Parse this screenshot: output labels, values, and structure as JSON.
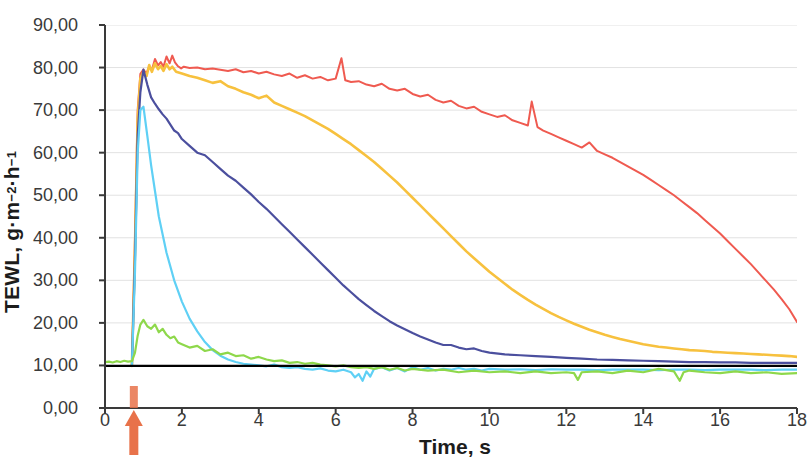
{
  "chart_data": {
    "type": "line",
    "title": "",
    "xlabel": "Time, s",
    "ylabel": "TEWL, g·m⁻²·h⁻¹",
    "ylabel_parts": {
      "main": "TEWL, g·m",
      "sup1": "−2",
      "mid": "·h",
      "sup2": "−1"
    },
    "xlim": [
      0,
      18
    ],
    "ylim": [
      0,
      90
    ],
    "grid": "horizontal",
    "legend": "none",
    "xticks": [
      "0",
      "2",
      "4",
      "6",
      "8",
      "10",
      "12",
      "14",
      "16",
      "18"
    ],
    "xtick_values": [
      0,
      2,
      4,
      6,
      8,
      10,
      12,
      14,
      16,
      18
    ],
    "yticks": [
      "0,00",
      "10,00",
      "20,00",
      "30,00",
      "40,00",
      "50,00",
      "60,00",
      "70,00",
      "80,00",
      "90,00"
    ],
    "ytick_values": [
      0,
      10,
      20,
      30,
      40,
      50,
      60,
      70,
      80,
      90
    ],
    "annotations": [
      {
        "name": "application-arrow",
        "type": "arrow-up",
        "x": 0.75,
        "color": "#e8724a",
        "description": "orange up arrow below x-axis at t=0.75 s"
      }
    ],
    "reference_line": {
      "name": "baseline",
      "y": 9.9,
      "color": "#000000",
      "width": 2.4,
      "x_from": 0,
      "x_to": 18
    },
    "series": [
      {
        "name": "series-red",
        "color": "#ef5a50",
        "width": 2.0,
        "x": [
          0.7,
          0.78,
          0.85,
          0.92,
          1.0,
          1.08,
          1.15,
          1.22,
          1.3,
          1.38,
          1.45,
          1.52,
          1.6,
          1.68,
          1.75,
          1.82,
          1.9,
          1.98,
          2.05,
          2.2,
          2.4,
          2.6,
          2.8,
          3.0,
          3.2,
          3.4,
          3.6,
          3.8,
          4.0,
          4.2,
          4.4,
          4.6,
          4.8,
          5.0,
          5.2,
          5.4,
          5.6,
          5.8,
          6.0,
          6.15,
          6.25,
          6.4,
          6.6,
          6.8,
          7.0,
          7.2,
          7.4,
          7.6,
          7.8,
          8.0,
          8.2,
          8.4,
          8.6,
          8.8,
          9.0,
          9.2,
          9.4,
          9.6,
          9.8,
          10.0,
          10.2,
          10.4,
          10.6,
          10.8,
          11.0,
          11.1,
          11.25,
          11.4,
          11.6,
          11.8,
          12.0,
          12.2,
          12.4,
          12.6,
          12.8,
          13.0,
          13.2,
          13.4,
          13.6,
          13.8,
          14.0,
          14.2,
          14.4,
          14.6,
          14.8,
          15.0,
          15.2,
          15.4,
          15.6,
          15.8,
          16.0,
          16.2,
          16.4,
          16.6,
          16.8,
          17.0,
          17.2,
          17.4,
          17.6,
          17.8,
          18.0
        ],
        "y": [
          9.9,
          40.0,
          70.0,
          78.5,
          79.5,
          78.6,
          80.2,
          79.4,
          82.0,
          80.5,
          81.3,
          80.2,
          82.6,
          81.0,
          82.8,
          81.2,
          80.3,
          79.8,
          80.2,
          79.9,
          80.0,
          79.6,
          79.8,
          79.5,
          79.2,
          79.6,
          78.9,
          79.2,
          78.6,
          79.0,
          78.4,
          78.0,
          78.6,
          77.6,
          78.2,
          77.4,
          77.8,
          77.0,
          77.4,
          82.2,
          77.0,
          76.6,
          76.8,
          76.0,
          75.6,
          76.2,
          75.0,
          74.6,
          75.0,
          73.8,
          73.2,
          73.6,
          72.4,
          71.8,
          72.2,
          71.0,
          70.4,
          70.8,
          69.6,
          69.0,
          68.4,
          68.8,
          67.6,
          67.0,
          66.4,
          72.0,
          66.0,
          65.2,
          64.4,
          63.6,
          62.8,
          62.0,
          61.2,
          62.4,
          60.4,
          59.6,
          58.8,
          57.8,
          56.8,
          55.8,
          54.8,
          53.6,
          52.4,
          51.2,
          50.0,
          48.6,
          47.2,
          45.8,
          44.2,
          42.6,
          41.0,
          39.2,
          37.4,
          35.6,
          33.8,
          31.8,
          29.8,
          27.8,
          25.6,
          23.2,
          20.2
        ]
      },
      {
        "name": "series-yellow",
        "color": "#f7c13e",
        "width": 2.6,
        "x": [
          0.7,
          0.78,
          0.85,
          0.92,
          1.0,
          1.08,
          1.15,
          1.22,
          1.3,
          1.38,
          1.45,
          1.52,
          1.6,
          1.68,
          1.75,
          1.85,
          2.0,
          2.2,
          2.4,
          2.6,
          2.8,
          3.0,
          3.2,
          3.4,
          3.6,
          3.8,
          4.0,
          4.2,
          4.4,
          4.6,
          4.8,
          5.0,
          5.2,
          5.4,
          5.6,
          5.8,
          6.0,
          6.2,
          6.4,
          6.6,
          6.8,
          7.0,
          7.2,
          7.4,
          7.6,
          7.8,
          8.0,
          8.2,
          8.4,
          8.6,
          8.8,
          9.0,
          9.2,
          9.4,
          9.6,
          9.8,
          10.0,
          10.2,
          10.4,
          10.6,
          10.8,
          11.0,
          11.2,
          11.4,
          11.6,
          11.8,
          12.0,
          12.2,
          12.4,
          12.6,
          12.8,
          13.0,
          13.2,
          13.4,
          13.6,
          13.8,
          14.0,
          14.2,
          14.4,
          14.6,
          14.8,
          15.0,
          15.2,
          15.4,
          15.6,
          15.8,
          16.0,
          16.2,
          16.4,
          16.6,
          16.8,
          17.0,
          17.2,
          17.4,
          17.6,
          17.8,
          18.0
        ],
        "y": [
          9.9,
          38.0,
          68.0,
          77.5,
          79.0,
          78.0,
          80.6,
          79.0,
          81.0,
          79.6,
          80.4,
          79.2,
          80.8,
          79.6,
          80.2,
          79.0,
          78.6,
          78.0,
          77.6,
          77.0,
          76.4,
          76.8,
          75.6,
          75.0,
          74.2,
          73.6,
          72.8,
          73.4,
          71.8,
          71.0,
          70.2,
          69.4,
          68.6,
          67.6,
          66.6,
          65.6,
          64.4,
          63.2,
          62.0,
          60.6,
          59.2,
          57.8,
          56.2,
          54.6,
          53.0,
          51.2,
          49.4,
          47.6,
          45.8,
          44.0,
          42.2,
          40.4,
          38.6,
          36.8,
          35.2,
          33.6,
          32.0,
          30.6,
          29.2,
          27.8,
          26.6,
          25.4,
          24.3,
          23.3,
          22.3,
          21.4,
          20.6,
          19.8,
          19.1,
          18.4,
          17.8,
          17.2,
          16.7,
          16.2,
          15.8,
          15.4,
          15.0,
          14.7,
          14.4,
          14.2,
          14.0,
          13.8,
          13.6,
          13.5,
          13.4,
          13.2,
          13.1,
          13.0,
          12.9,
          12.8,
          12.7,
          12.6,
          12.5,
          12.4,
          12.3,
          12.2,
          12.0
        ]
      },
      {
        "name": "series-purple",
        "color": "#4b4f9e",
        "width": 2.2,
        "x": [
          0.7,
          0.78,
          0.85,
          0.92,
          1.0,
          1.1,
          1.2,
          1.3,
          1.4,
          1.5,
          1.6,
          1.7,
          1.8,
          1.9,
          2.0,
          2.2,
          2.4,
          2.6,
          2.8,
          3.0,
          3.2,
          3.4,
          3.6,
          3.8,
          4.0,
          4.2,
          4.4,
          4.6,
          4.8,
          5.0,
          5.2,
          5.4,
          5.6,
          5.8,
          6.0,
          6.2,
          6.4,
          6.6,
          6.8,
          7.0,
          7.2,
          7.4,
          7.6,
          7.8,
          8.0,
          8.2,
          8.4,
          8.6,
          8.8,
          9.0,
          9.2,
          9.4,
          9.6,
          9.8,
          10.0,
          10.4,
          10.8,
          11.2,
          11.6,
          12.0,
          12.4,
          12.8,
          13.2,
          13.6,
          14.0,
          14.4,
          14.8,
          15.2,
          15.6,
          16.0,
          16.4,
          16.8,
          17.2,
          17.6,
          18.0
        ],
        "y": [
          9.9,
          35.0,
          64.0,
          74.2,
          79.5,
          76.0,
          73.0,
          71.5,
          70.2,
          69.0,
          68.0,
          66.6,
          65.2,
          64.6,
          63.2,
          61.6,
          60.0,
          59.4,
          57.8,
          56.2,
          54.6,
          53.4,
          51.8,
          50.2,
          48.4,
          46.8,
          45.0,
          43.2,
          41.4,
          39.6,
          37.8,
          36.0,
          34.2,
          32.4,
          30.6,
          28.8,
          27.2,
          25.6,
          24.2,
          22.8,
          21.6,
          20.4,
          19.4,
          18.5,
          17.6,
          16.8,
          16.1,
          15.4,
          14.8,
          14.8,
          14.2,
          13.8,
          14.0,
          13.4,
          13.0,
          12.6,
          12.4,
          12.2,
          12.0,
          11.8,
          11.6,
          11.4,
          11.3,
          11.2,
          11.1,
          11.0,
          10.9,
          10.8,
          10.8,
          10.7,
          10.7,
          10.6,
          10.6,
          10.6,
          10.6
        ]
      },
      {
        "name": "series-cyan",
        "color": "#5fd0f5",
        "width": 2.2,
        "x": [
          0.7,
          0.78,
          0.85,
          0.92,
          1.0,
          1.1,
          1.2,
          1.3,
          1.4,
          1.6,
          1.8,
          2.0,
          2.2,
          2.4,
          2.6,
          2.8,
          3.0,
          3.2,
          3.4,
          3.6,
          3.8,
          4.0,
          4.2,
          4.4,
          4.6,
          4.8,
          5.0,
          5.2,
          5.4,
          5.6,
          5.8,
          6.0,
          6.2,
          6.4,
          6.5,
          6.6,
          6.7,
          6.8,
          6.9,
          7.0,
          7.2,
          7.4,
          7.6,
          7.8,
          8.0,
          8.2,
          8.4,
          8.6,
          8.8,
          9.0,
          9.2,
          9.4,
          9.6,
          9.8,
          10.0,
          10.4,
          10.8,
          11.2,
          11.6,
          12.0,
          12.4,
          12.8,
          13.2,
          13.6,
          14.0,
          14.4,
          14.8,
          15.2,
          15.6,
          16.0,
          16.4,
          16.8,
          17.2,
          17.6,
          18.0
        ],
        "y": [
          9.9,
          32.0,
          60.0,
          70.0,
          70.8,
          64.0,
          57.0,
          51.0,
          45.0,
          36.5,
          30.0,
          25.0,
          21.0,
          18.0,
          15.5,
          13.6,
          12.3,
          11.4,
          10.8,
          10.4,
          10.2,
          10.0,
          9.8,
          10.2,
          9.6,
          9.4,
          9.6,
          9.2,
          9.0,
          9.3,
          8.8,
          8.6,
          9.0,
          8.4,
          7.2,
          8.0,
          6.4,
          8.6,
          7.4,
          9.2,
          9.6,
          8.8,
          9.4,
          8.6,
          9.6,
          9.0,
          9.4,
          8.8,
          9.2,
          9.0,
          9.4,
          9.0,
          9.2,
          8.8,
          9.2,
          9.0,
          9.1,
          8.9,
          9.1,
          9.0,
          9.0,
          8.9,
          9.0,
          9.0,
          9.0,
          8.9,
          9.0,
          9.0,
          8.9,
          9.0,
          9.0,
          9.0,
          8.9,
          9.0,
          9.0
        ]
      },
      {
        "name": "series-green",
        "color": "#8ed84b",
        "width": 2.2,
        "x": [
          0.0,
          0.1,
          0.2,
          0.3,
          0.4,
          0.5,
          0.6,
          0.7,
          0.78,
          0.85,
          0.92,
          1.0,
          1.1,
          1.2,
          1.3,
          1.4,
          1.5,
          1.6,
          1.7,
          1.8,
          1.9,
          2.0,
          2.2,
          2.4,
          2.6,
          2.8,
          3.0,
          3.2,
          3.4,
          3.6,
          3.8,
          4.0,
          4.2,
          4.4,
          4.6,
          4.8,
          5.0,
          5.2,
          5.4,
          5.6,
          5.8,
          6.0,
          6.2,
          6.4,
          6.6,
          6.8,
          7.0,
          7.2,
          7.4,
          7.6,
          7.8,
          8.0,
          8.4,
          8.8,
          9.2,
          9.6,
          10.0,
          10.4,
          10.8,
          11.2,
          11.6,
          12.0,
          12.2,
          12.3,
          12.4,
          12.8,
          13.2,
          13.6,
          14.0,
          14.4,
          14.8,
          14.95,
          15.05,
          15.2,
          15.6,
          16.0,
          16.4,
          16.8,
          17.2,
          17.6,
          18.0
        ],
        "y": [
          10.8,
          10.9,
          10.7,
          11.0,
          10.8,
          11.1,
          10.9,
          11.0,
          13.0,
          17.0,
          19.6,
          20.7,
          19.2,
          18.6,
          19.6,
          17.8,
          18.6,
          17.2,
          16.4,
          16.8,
          15.4,
          15.0,
          14.2,
          14.6,
          13.4,
          13.8,
          12.6,
          13.0,
          12.2,
          12.4,
          11.6,
          12.0,
          11.4,
          11.0,
          11.2,
          10.6,
          10.8,
          10.4,
          10.6,
          10.2,
          10.0,
          9.8,
          10.0,
          9.6,
          9.4,
          9.6,
          9.2,
          9.6,
          9.0,
          9.4,
          8.8,
          9.2,
          8.8,
          9.0,
          8.4,
          8.8,
          8.4,
          8.6,
          8.2,
          8.6,
          8.2,
          8.4,
          8.2,
          6.6,
          8.4,
          8.6,
          8.2,
          8.8,
          8.4,
          9.2,
          8.6,
          6.4,
          8.4,
          8.8,
          8.4,
          8.2,
          8.6,
          8.2,
          8.4,
          8.0,
          8.2
        ]
      }
    ]
  },
  "axes": {
    "x_axis_color": "#3a3a3a",
    "y_axis_color": "#3a3a3a",
    "grid_color": "#e2e2e2",
    "background": "#ffffff"
  }
}
